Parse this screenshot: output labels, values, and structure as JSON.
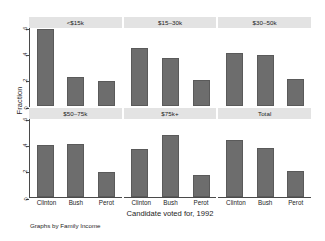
{
  "chart_data": {
    "type": "bar",
    "title": "",
    "xlabel": "Candidate voted for, 1992",
    "ylabel": "Fraction",
    "note": "Graphs by Family Income",
    "categories": [
      "Clinton",
      "Bush",
      "Perot"
    ],
    "ylim": [
      0,
      0.6
    ],
    "yticks": [
      0,
      0.2,
      0.4,
      0.6
    ],
    "ytick_labels": [
      "0",
      ".2",
      ".4",
      ".6"
    ],
    "grid": false,
    "legend": "none",
    "layout": "2 rows x 3 columns of small-multiple panels",
    "bar_color": "#6d6d6d",
    "panel_header_color": "#e3e3e3",
    "panels": [
      {
        "label": "<$15k",
        "values": [
          0.59,
          0.22,
          0.19
        ]
      },
      {
        "label": "$15–30k",
        "values": [
          0.45,
          0.37,
          0.2
        ]
      },
      {
        "label": "$30–50k",
        "values": [
          0.41,
          0.39,
          0.21
        ]
      },
      {
        "label": "$50–75k",
        "values": [
          0.4,
          0.41,
          0.19
        ]
      },
      {
        "label": "$75k+",
        "values": [
          0.37,
          0.48,
          0.17
        ]
      },
      {
        "label": "Total",
        "values": [
          0.44,
          0.38,
          0.2
        ]
      }
    ]
  }
}
